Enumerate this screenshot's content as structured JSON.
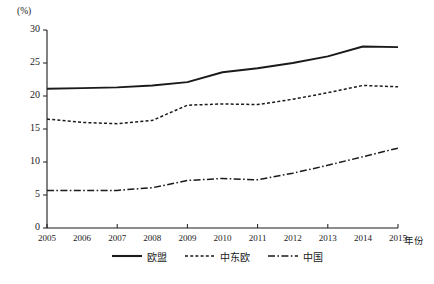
{
  "chart_data": {
    "type": "line",
    "title": "",
    "xlabel": "年份",
    "ylabel": "(%)",
    "x": [
      2005,
      2006,
      2007,
      2008,
      2009,
      2010,
      2011,
      2012,
      2013,
      2014,
      2015
    ],
    "categories": [
      "2005",
      "2006",
      "2007",
      "2008",
      "2009",
      "2010",
      "2011",
      "2012",
      "2013",
      "2014",
      "2015"
    ],
    "xlim": [
      2005,
      2015
    ],
    "ylim": [
      0,
      30
    ],
    "yticks": [
      0,
      5,
      10,
      15,
      20,
      25,
      30
    ],
    "ytick_labels": [
      "0",
      "5",
      "10",
      "15",
      "20",
      "25",
      "30"
    ],
    "grid": false,
    "legend_position": "bottom",
    "series": [
      {
        "name": "欧盟",
        "style": "solid",
        "color": "#1a1a1a",
        "values": [
          21.1,
          21.2,
          21.3,
          21.6,
          22.1,
          23.6,
          24.2,
          25.0,
          26.0,
          27.5,
          27.4
        ]
      },
      {
        "name": "中东欧",
        "style": "dotted",
        "color": "#1a1a1a",
        "values": [
          16.5,
          16.0,
          15.8,
          16.3,
          18.6,
          18.8,
          18.7,
          19.5,
          20.5,
          21.6,
          21.4
        ]
      },
      {
        "name": "中国",
        "style": "dash-dot",
        "color": "#1a1a1a",
        "values": [
          5.7,
          5.7,
          5.7,
          6.1,
          7.2,
          7.5,
          7.3,
          8.3,
          9.5,
          10.8,
          12.1
        ]
      }
    ]
  },
  "axes": {
    "y_unit": "(%)",
    "x_title": "年份"
  },
  "legend": {
    "items": [
      {
        "label": "欧盟",
        "style": "solid"
      },
      {
        "label": "中东欧",
        "style": "dotted"
      },
      {
        "label": "中国",
        "style": "dash-dot"
      }
    ]
  },
  "caption": {
    "text": ""
  }
}
